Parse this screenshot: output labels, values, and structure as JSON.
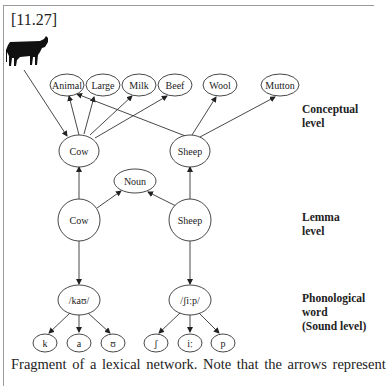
{
  "figure": {
    "label": "[11.27]",
    "caption": "Fragment of a lexical network. Note that the arrows represent"
  },
  "levels": {
    "conceptual": [
      "Conceptual",
      "level"
    ],
    "lemma": [
      "Lemma",
      "level"
    ],
    "phonological": [
      "Phonological",
      "word",
      "(Sound level)"
    ]
  },
  "nodes": {
    "conceptual_features": [
      "Animal",
      "Large",
      "Milk",
      "Beef",
      "Wool",
      "Mutton"
    ],
    "concepts": [
      "Cow",
      "Sheep"
    ],
    "syntax": "Noun",
    "lemmas": [
      "Cow",
      "Sheep"
    ],
    "phonological_words": [
      "/kaʊ/",
      "/ʃiːp/"
    ],
    "phonemes_cow": [
      "k",
      "a",
      "ʊ"
    ],
    "phonemes_sheep": [
      "ʃ",
      "iː",
      "p"
    ]
  },
  "edges": [
    {
      "from": "cow-image",
      "to": "Cow (concept)"
    },
    {
      "from": "Cow (concept)",
      "to": "Animal"
    },
    {
      "from": "Cow (concept)",
      "to": "Large"
    },
    {
      "from": "Cow (concept)",
      "to": "Milk"
    },
    {
      "from": "Cow (concept)",
      "to": "Beef"
    },
    {
      "from": "Sheep (concept)",
      "to": "Animal"
    },
    {
      "from": "Sheep (concept)",
      "to": "Wool"
    },
    {
      "from": "Sheep (concept)",
      "to": "Mutton"
    },
    {
      "from": "Cow (lemma)",
      "to": "Cow (concept)"
    },
    {
      "from": "Sheep (lemma)",
      "to": "Sheep (concept)"
    },
    {
      "from": "Cow (lemma)",
      "to": "Noun"
    },
    {
      "from": "Sheep (lemma)",
      "to": "Noun"
    },
    {
      "from": "Cow (lemma)",
      "to": "/kaʊ/"
    },
    {
      "from": "Sheep (lemma)",
      "to": "/ʃiːp/"
    },
    {
      "from": "/kaʊ/",
      "to": "k"
    },
    {
      "from": "/kaʊ/",
      "to": "a"
    },
    {
      "from": "/kaʊ/",
      "to": "ʊ"
    },
    {
      "from": "/ʃiːp/",
      "to": "ʃ"
    },
    {
      "from": "/ʃiːp/",
      "to": "iː"
    },
    {
      "from": "/ʃiːp/",
      "to": "p"
    }
  ]
}
